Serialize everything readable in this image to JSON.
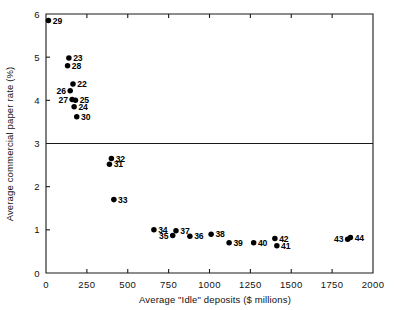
{
  "chart_data": {
    "type": "scatter",
    "title": "",
    "xlabel": "Average \"Idle\" deposits ($ millions)",
    "ylabel": "Average commercial paper rate (%)",
    "xlim": [
      0,
      2000
    ],
    "ylim": [
      0,
      6
    ],
    "xticks": [
      0,
      250,
      500,
      750,
      1000,
      1250,
      1500,
      1750,
      2000
    ],
    "xticklabels": [
      "0",
      "250",
      "500",
      "750",
      "1000",
      "1250",
      "1500",
      "1750",
      "2000"
    ],
    "yticks": [
      0,
      1,
      2,
      3,
      4,
      5,
      6
    ],
    "yticklabels": [
      "0",
      "1",
      "2",
      "3",
      "4",
      "5",
      "6"
    ],
    "grid": false,
    "legend": "none",
    "reference_lines": [
      {
        "axis": "y",
        "value": 3,
        "style": "solid"
      }
    ],
    "marker": {
      "shape": "circle",
      "color": "#000000",
      "size": 4
    },
    "points": [
      {
        "label": "29",
        "x": 15,
        "y": 5.85,
        "label_pos": "right"
      },
      {
        "label": "23",
        "x": 140,
        "y": 4.98,
        "label_pos": "right"
      },
      {
        "label": "28",
        "x": 132,
        "y": 4.8,
        "label_pos": "right"
      },
      {
        "label": "22",
        "x": 165,
        "y": 4.38,
        "label_pos": "right"
      },
      {
        "label": "26",
        "x": 148,
        "y": 4.22,
        "label_pos": "left"
      },
      {
        "label": "27",
        "x": 160,
        "y": 4.02,
        "label_pos": "left"
      },
      {
        "label": "25",
        "x": 180,
        "y": 4.0,
        "label_pos": "right"
      },
      {
        "label": "24",
        "x": 172,
        "y": 3.85,
        "label_pos": "right"
      },
      {
        "label": "30",
        "x": 188,
        "y": 3.62,
        "label_pos": "right"
      },
      {
        "label": "32",
        "x": 400,
        "y": 2.65,
        "label_pos": "right"
      },
      {
        "label": "31",
        "x": 388,
        "y": 2.52,
        "label_pos": "right"
      },
      {
        "label": "33",
        "x": 415,
        "y": 1.7,
        "label_pos": "right"
      },
      {
        "label": "34",
        "x": 660,
        "y": 1.0,
        "label_pos": "right"
      },
      {
        "label": "37",
        "x": 795,
        "y": 0.98,
        "label_pos": "right"
      },
      {
        "label": "35",
        "x": 775,
        "y": 0.87,
        "label_pos": "left"
      },
      {
        "label": "36",
        "x": 880,
        "y": 0.85,
        "label_pos": "right"
      },
      {
        "label": "38",
        "x": 1010,
        "y": 0.9,
        "label_pos": "right"
      },
      {
        "label": "39",
        "x": 1120,
        "y": 0.7,
        "label_pos": "right"
      },
      {
        "label": "40",
        "x": 1270,
        "y": 0.7,
        "label_pos": "right"
      },
      {
        "label": "42",
        "x": 1400,
        "y": 0.8,
        "label_pos": "right"
      },
      {
        "label": "41",
        "x": 1412,
        "y": 0.63,
        "label_pos": "right"
      },
      {
        "label": "43",
        "x": 1845,
        "y": 0.78,
        "label_pos": "left"
      },
      {
        "label": "44",
        "x": 1862,
        "y": 0.82,
        "label_pos": "right"
      }
    ]
  }
}
